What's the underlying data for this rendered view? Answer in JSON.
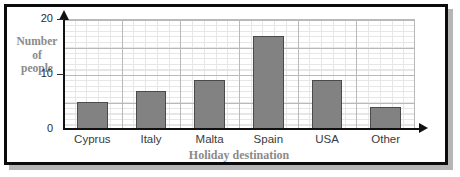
{
  "chart_data": {
    "type": "bar",
    "title": "",
    "categories": [
      "Cyprus",
      "Italy",
      "Malta",
      "Spain",
      "USA",
      "Other"
    ],
    "values": [
      5,
      7,
      9,
      17,
      9,
      4
    ],
    "xlabel": "Holiday destination",
    "ylabel": "Number of people",
    "ylabel_lines": [
      "Number",
      "of",
      "people"
    ],
    "ylim": [
      0,
      20
    ],
    "y_ticks": [
      0,
      10,
      20
    ],
    "y_tick_labels": [
      "0",
      "10",
      "20"
    ],
    "y_major_step": 5,
    "y_minor_step": 1,
    "grid": true,
    "legend": null,
    "bar_color": "#828282",
    "bar_edge_color": "#4a4a4a",
    "axis_color": "#111111",
    "grid_major_color": "#b9b9b9",
    "grid_minor_color": "#e6e6e6",
    "label_color": "#8a8a8a",
    "tick_label_color": "#3a3a3a"
  }
}
